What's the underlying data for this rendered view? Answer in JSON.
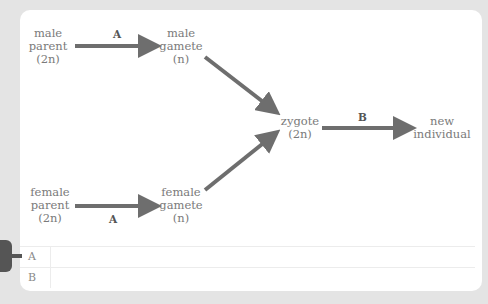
{
  "diagram": {
    "nodes": {
      "male_parent": [
        "male",
        "parent",
        "(2n)"
      ],
      "male_gamete": [
        "male",
        "gamete",
        "(n)"
      ],
      "female_parent": [
        "female",
        "parent",
        "(2n)"
      ],
      "female_gamete": [
        "female",
        "gamete",
        "(n)"
      ],
      "zygote": [
        "zygote",
        "(2n)"
      ],
      "new_individual": [
        "new",
        "individual"
      ]
    },
    "arrow_labels": {
      "male_meiosis": "A",
      "female_meiosis": "A",
      "development": "B"
    },
    "arrow_color": "#6e6e6e"
  },
  "answers": [
    {
      "key": "A",
      "value": ""
    },
    {
      "key": "B",
      "value": ""
    }
  ]
}
